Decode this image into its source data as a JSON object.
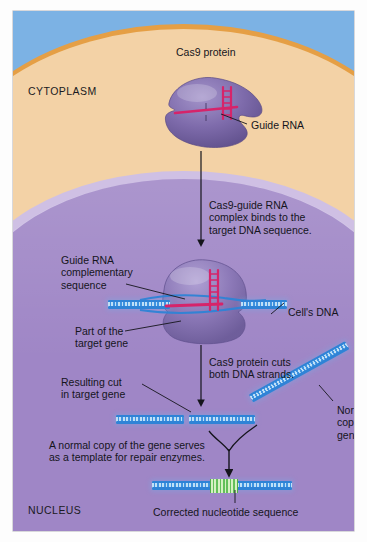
{
  "diagram": {
    "regions": {
      "cytoplasm": "CYTOPLASM",
      "nucleus": "NUCLEUS"
    },
    "labels": {
      "cas9_protein": "Cas9 protein",
      "guide_rna": "Guide RNA",
      "guide_rna_complementary": "Guide RNA\ncomplementary\nsequence",
      "cells_dna": "Cell's DNA",
      "part_of_target_gene": "Part of the\ntarget gene",
      "resulting_cut": "Resulting cut\nin target gene",
      "normal_copy_of_gene": "Normal\ncopy of\ngene",
      "corrected_sequence": "Corrected nucleotide sequence"
    },
    "steps": {
      "step1": "Cas9-guide RNA\ncomplex binds to the\ntarget DNA sequence.",
      "step2": "Cas9 protein cuts\nboth DNA strands.",
      "step3": "A normal copy of the gene serves\nas a template for repair enzymes."
    },
    "colors": {
      "extracellular": "#7cb2e4",
      "membrane": "#e59f45",
      "cytoplasm": "#f3d2a6",
      "nuclear_envelope": "#cfc0e4",
      "nucleoplasm": "#9f86c6",
      "cas9_protein": "#7e6bab",
      "guide_rna": "#d6246a",
      "dna_strand": "#2f83d6",
      "corrected_segment": "#63c05a",
      "text": "#15151c"
    }
  }
}
